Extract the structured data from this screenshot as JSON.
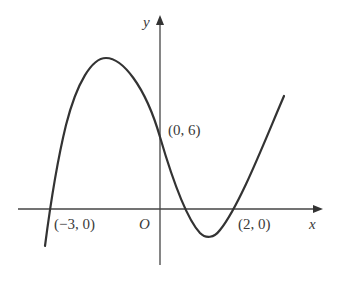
{
  "figure": {
    "type": "function-graph",
    "axes": {
      "x_label": "x",
      "y_label": "y",
      "origin_label": "O"
    },
    "points": [
      {
        "label": "(−3, 0)",
        "x": -3,
        "y": 0
      },
      {
        "label": "(0, 6)",
        "x": 0,
        "y": 6
      },
      {
        "label": "(2, 0)",
        "x": 2,
        "y": 0
      }
    ],
    "curve": {
      "description": "cubic polynomial with local maximum left of y-axis and local minimum between x=0 and x=2",
      "color": "#333333"
    }
  }
}
